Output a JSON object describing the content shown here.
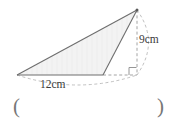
{
  "figure": {
    "kind": "geometry-diagram",
    "labels": {
      "height": "9cm",
      "base": "12cm"
    },
    "answer_field": {
      "left_paren": "(",
      "right_paren": ")"
    },
    "colors": {
      "stroke": "#6e6e6e",
      "dashed": "#9a9a9a",
      "fill": "#f2f2f2",
      "text": "#3b3b3b",
      "background": "#ffffff"
    },
    "geometry": {
      "apex": [
        137,
        10
      ],
      "base_left": [
        17,
        75
      ],
      "base_right": [
        103,
        75
      ],
      "foot": [
        137,
        75
      ],
      "height_value": 9,
      "base_value": 12,
      "units": "cm",
      "right_angle_marker": true
    }
  }
}
